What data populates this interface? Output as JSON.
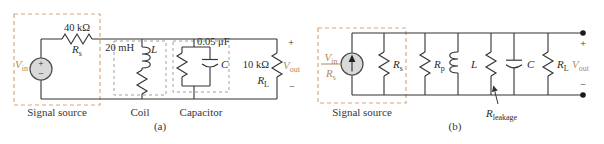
{
  "figure": {
    "caption_a": "(a)",
    "caption_b": "(b)"
  },
  "palette": {
    "accent_tan_text": "#b4885c",
    "signal_box_dash": "#d7a87c",
    "component_box_dash": "#a0a0a0",
    "wire": "#333333",
    "source_fill": "#d9d9d9"
  },
  "circuit_a": {
    "signal_source_label": "Signal source",
    "coil_label": "Coil",
    "capacitor_label": "Capacitor",
    "vin_main": "V",
    "vin_sub": "in",
    "source_plus": "+",
    "source_minus": "−",
    "rs_value": "40 kΩ",
    "rs_main": "R",
    "rs_sub": "s",
    "inductance_value": "20 mH",
    "inductor_name": "L",
    "capacitance_value": "0.05 μF",
    "capacitor_name": "C",
    "rl_value": "10 kΩ",
    "rl_main": "R",
    "rl_sub": "L",
    "vout_main": "V",
    "vout_sub": "out",
    "vout_plus": "+",
    "vout_minus": "−"
  },
  "circuit_b": {
    "signal_source_label": "Signal source",
    "source_num_main": "V",
    "source_num_sub": "in",
    "source_den_main": "R",
    "source_den_sub": "s",
    "rs_main": "R",
    "rs_sub": "s",
    "rp_main": "R",
    "rp_sub": "p",
    "inductor_name": "L",
    "rleak_main": "R",
    "rleak_sub": "leakage",
    "capacitor_name": "C",
    "rl_main": "R",
    "rl_sub": "L",
    "vout_main": "V",
    "vout_sub": "out",
    "vout_plus": "+",
    "vout_minus": "−"
  }
}
